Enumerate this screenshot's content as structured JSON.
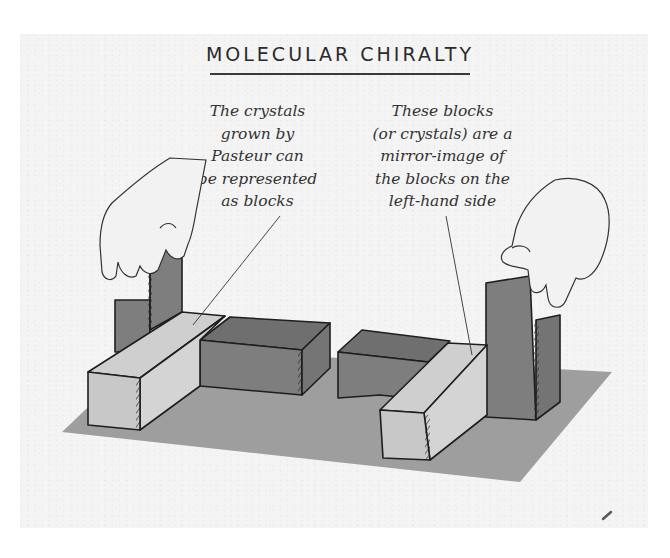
{
  "title": "MOLECULAR CHIRALTY",
  "captions": {
    "left": {
      "lines": [
        "The crystals",
        "grown by",
        "Pasteur can",
        "be represented",
        "as blocks"
      ]
    },
    "right": {
      "lines": [
        "These blocks",
        "(or crystals) are a",
        "mirror-image of",
        "the blocks on the",
        "left-hand side"
      ]
    }
  },
  "colors": {
    "background_panel": "#f4f4f4",
    "floor": "#9e9e9e",
    "block_light": "#cfcfcf",
    "block_dark": "#7e7e7e",
    "outline": "#1e1e1e",
    "hand": "#f2f2f2"
  },
  "illustration": {
    "left_group": "L-shaped block arrangement held by a left hand",
    "right_group": "mirror-image block arrangement held by a right hand"
  }
}
